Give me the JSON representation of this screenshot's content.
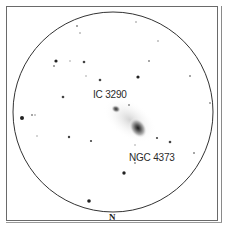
{
  "chart": {
    "view": "eyepiece field finder chart",
    "orientation_label": "N",
    "circle": {
      "cx": 113,
      "cy": 112,
      "r": 100,
      "stroke": "#333333"
    },
    "objects": [
      {
        "name": "IC 3290",
        "x": 116,
        "y": 109,
        "rx": 5,
        "ry": 4,
        "label_x": 93,
        "label_y": 89
      },
      {
        "name": "NGC 4373",
        "x": 138,
        "y": 128,
        "rx": 11,
        "ry": 8,
        "label_x": 129,
        "label_y": 152
      }
    ],
    "stars": [
      {
        "x": 77,
        "y": 26,
        "r": 1.0
      },
      {
        "x": 80,
        "y": 33,
        "r": 0.8
      },
      {
        "x": 56,
        "y": 61,
        "r": 1.6
      },
      {
        "x": 54,
        "y": 66,
        "r": 1.0
      },
      {
        "x": 70,
        "y": 61,
        "r": 0.7
      },
      {
        "x": 84,
        "y": 62,
        "r": 1.3
      },
      {
        "x": 86,
        "y": 76,
        "r": 0.7
      },
      {
        "x": 100,
        "y": 80,
        "r": 1.3
      },
      {
        "x": 63,
        "y": 97,
        "r": 1.3
      },
      {
        "x": 136,
        "y": 22,
        "r": 0.8
      },
      {
        "x": 158,
        "y": 41,
        "r": 0.8
      },
      {
        "x": 149,
        "y": 61,
        "r": 1.0
      },
      {
        "x": 138,
        "y": 77,
        "r": 1.6
      },
      {
        "x": 190,
        "y": 76,
        "r": 1.0
      },
      {
        "x": 210,
        "y": 103,
        "r": 0.9
      },
      {
        "x": 129,
        "y": 105,
        "r": 1.0
      },
      {
        "x": 22,
        "y": 118,
        "r": 2.0
      },
      {
        "x": 32,
        "y": 115,
        "r": 1.0
      },
      {
        "x": 35,
        "y": 115,
        "r": 0.8
      },
      {
        "x": 37,
        "y": 136,
        "r": 0.7
      },
      {
        "x": 69,
        "y": 137,
        "r": 1.2
      },
      {
        "x": 91,
        "y": 141,
        "r": 1.1
      },
      {
        "x": 89,
        "y": 201,
        "r": 1.8
      },
      {
        "x": 157,
        "y": 138,
        "r": 1.1
      },
      {
        "x": 170,
        "y": 142,
        "r": 1.3
      },
      {
        "x": 135,
        "y": 145,
        "r": 0.7
      },
      {
        "x": 194,
        "y": 153,
        "r": 1.0
      },
      {
        "x": 135,
        "y": 163,
        "r": 0.9
      },
      {
        "x": 124,
        "y": 173,
        "r": 1.7
      }
    ]
  }
}
